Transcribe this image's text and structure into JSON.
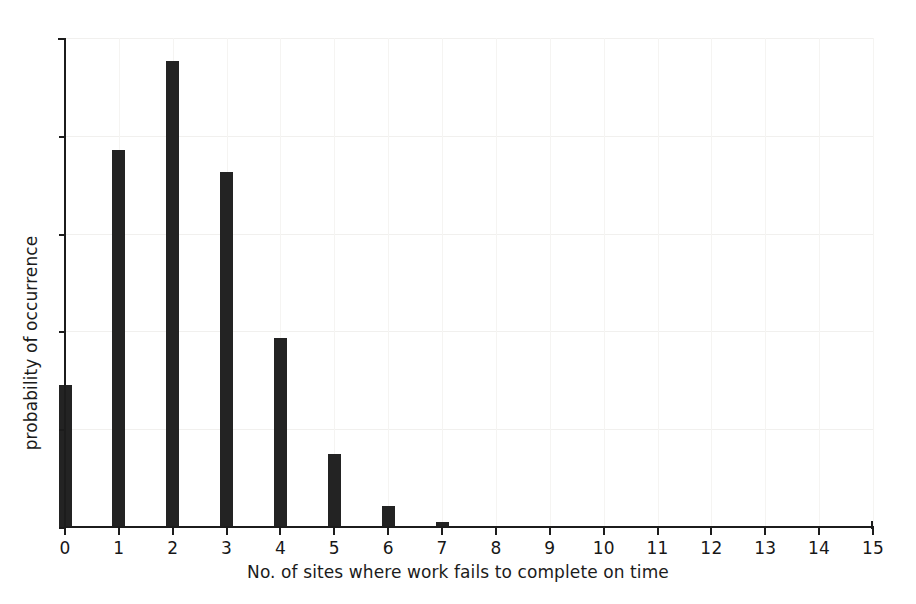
{
  "chart_data": {
    "type": "bar",
    "title": "",
    "subtitle": "",
    "xlabel": "No. of sites where work fails to complete on time",
    "ylabel": "probability of occurrence",
    "categories": [
      "0",
      "1",
      "2",
      "3",
      "4",
      "5",
      "6",
      "7",
      "8",
      "9",
      "10",
      "11",
      "12",
      "13",
      "14",
      "15"
    ],
    "values": [
      0.087,
      0.231,
      0.286,
      0.218,
      0.116,
      0.045,
      0.013,
      0.003,
      0.0,
      0.0,
      0.0,
      0.0,
      0.0,
      0.0,
      0.0,
      0.0
    ],
    "xlim": [
      0,
      15
    ],
    "ylim": [
      0,
      0.3
    ],
    "x_tick_labels": [
      "0",
      "1",
      "2",
      "3",
      "4",
      "5",
      "6",
      "7",
      "8",
      "9",
      "10",
      "11",
      "12",
      "13",
      "14",
      "15"
    ],
    "y_tick_labels": [
      "",
      "",
      "",
      "",
      "",
      ""
    ],
    "y_tick_values": [
      0.0,
      0.06,
      0.12,
      0.18,
      0.24,
      0.3
    ],
    "grid": true,
    "legend": false,
    "legend_position": "none",
    "bar_color": "#232323",
    "axis_color": "#1c1c1c",
    "grid_color": "#f1f0ee",
    "background_color": "#ffffff"
  }
}
